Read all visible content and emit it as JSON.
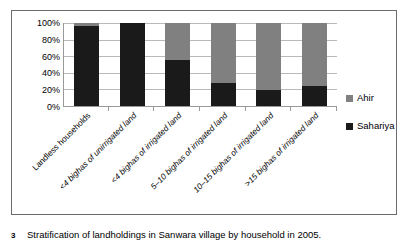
{
  "caption": {
    "number": "3",
    "text": "Stratification of landholdings in Sanwara village by household in 2005."
  },
  "legend": {
    "position": "right",
    "items": [
      {
        "label": "Ahir",
        "color": "#808080"
      },
      {
        "label": "Sahariya",
        "color": "#1a1a1a"
      }
    ]
  },
  "axis": {
    "y_ticks": [
      "100%",
      "80%",
      "60%",
      "40%",
      "20%",
      "0%"
    ]
  },
  "chart_data": {
    "type": "bar",
    "title": "",
    "subtitle": "",
    "xlabel": "",
    "ylabel": "",
    "stacked": true,
    "stacked_100pct": true,
    "grid": true,
    "ylim": [
      0,
      100
    ],
    "ytick_values": [
      0,
      20,
      40,
      60,
      80,
      100
    ],
    "ytick_labels": [
      "0%",
      "20%",
      "40%",
      "60%",
      "80%",
      "100%"
    ],
    "legend_position": "right",
    "categories": [
      "Landless households",
      "<4 bighas of unirrigated land",
      "<4 bighas of irrigated land",
      "5–10 bighas of irrigated land",
      "10–15 bighas of irrigated land",
      ">15 bighas of irrigated land"
    ],
    "series": [
      {
        "name": "Sahariya",
        "color": "#1a1a1a",
        "values": [
          97,
          100,
          56,
          28,
          19,
          24
        ]
      },
      {
        "name": "Ahir",
        "color": "#808080",
        "values": [
          3,
          0,
          44,
          72,
          81,
          76
        ]
      }
    ]
  }
}
